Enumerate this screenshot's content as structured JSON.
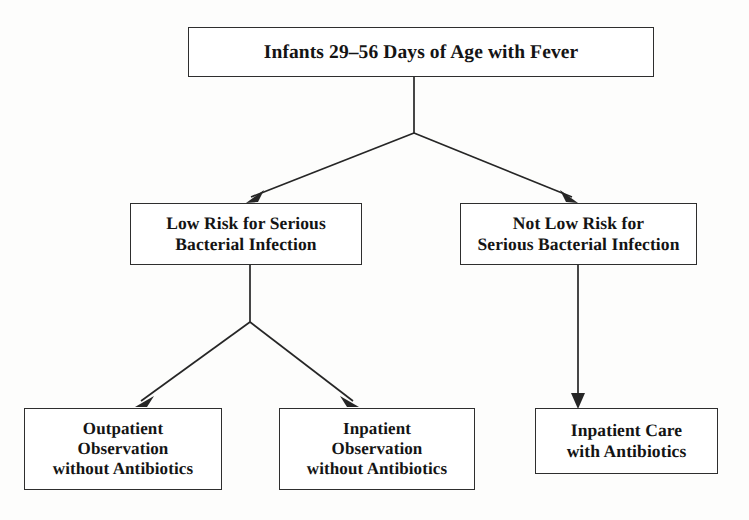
{
  "diagram": {
    "type": "flowchart",
    "title_text": "",
    "background_color": "#fdfdfc",
    "line_color": "#262626",
    "text_color": "#141414",
    "box_border_color": "#2e2e2e",
    "nodes": [
      {
        "id": "root",
        "label": "Infants 29–56 Days of Age with Fever",
        "level": 1
      },
      {
        "id": "low-risk",
        "label": "Low Risk for Serious\nBacterial Infection",
        "level": 2
      },
      {
        "id": "not-low-risk",
        "label": "Not Low Risk for\nSerious Bacterial Infection",
        "level": 2
      },
      {
        "id": "outpatient-observation",
        "label": "Outpatient\nObservation\nwithout Antibiotics",
        "level": 3
      },
      {
        "id": "inpatient-observation",
        "label": "Inpatient\nObservation\nwithout Antibiotics",
        "level": 3
      },
      {
        "id": "inpatient-care",
        "label": "Inpatient Care\nwith Antibiotics",
        "level": 3
      }
    ],
    "edges": [
      {
        "from": "root",
        "to": "low-risk",
        "style": "elbow-branch-arrow"
      },
      {
        "from": "root",
        "to": "not-low-risk",
        "style": "elbow-branch-arrow"
      },
      {
        "from": "low-risk",
        "to": "outpatient-observation",
        "style": "elbow-branch-arrow"
      },
      {
        "from": "low-risk",
        "to": "inpatient-observation",
        "style": "elbow-branch-arrow"
      },
      {
        "from": "not-low-risk",
        "to": "inpatient-care",
        "style": "straight-arrow"
      }
    ]
  }
}
